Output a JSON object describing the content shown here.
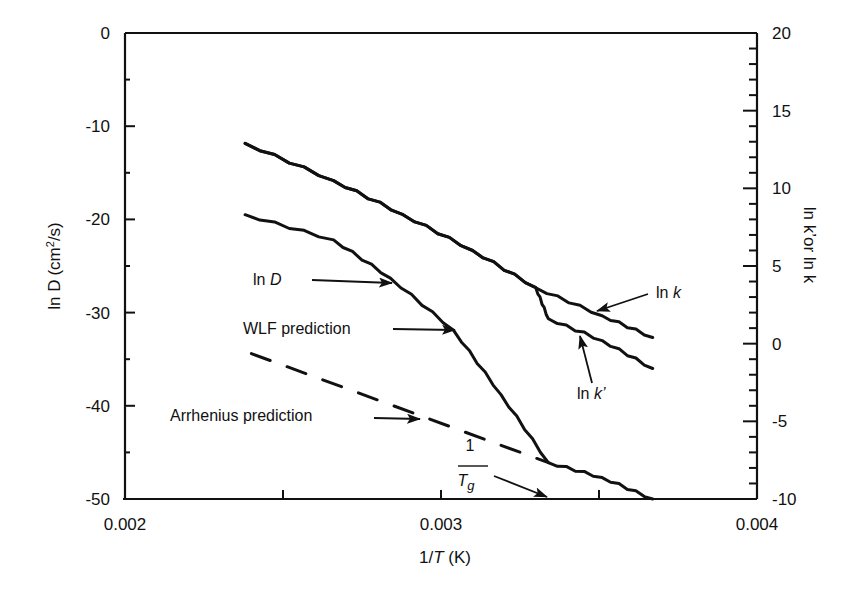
{
  "chart_data": {
    "type": "line",
    "title": "",
    "xlabel": "1/T (K)",
    "ylabel": "ln D  (cm2/s)",
    "y2label": "ln k' or ln k",
    "xlim": [
      0.002,
      0.004
    ],
    "ylim": [
      -50,
      0
    ],
    "y2lim": [
      -10,
      20
    ],
    "x_ticks": [
      "0.002",
      "0.003",
      "0.004"
    ],
    "y_ticks": [
      "0",
      "-10",
      "-20",
      "-30",
      "-40",
      "-50"
    ],
    "y2_ticks": [
      "20",
      "15",
      "10",
      "5",
      "0",
      "-5",
      "-10"
    ],
    "grid": false,
    "legend": "none (inline annotations with arrows)",
    "series": [
      {
        "name": "ln D",
        "axis": "left",
        "style": "solid",
        "x": [
          0.00238,
          0.00266,
          0.00284,
          0.00304,
          0.00319,
          0.00334,
          0.00351,
          0.00367
        ],
        "y": [
          -19.5,
          -22.2,
          -26.3,
          -31.9,
          -38.8,
          -46.1,
          -47.7,
          -50.0
        ]
      },
      {
        "name": "ln k",
        "axis": "right",
        "style": "solid",
        "x": [
          0.00238,
          0.00266,
          0.00288,
          0.0031,
          0.0033,
          0.00351,
          0.00367
        ],
        "y": [
          12.9,
          10.5,
          8.3,
          6.0,
          3.6,
          1.8,
          0.4
        ]
      },
      {
        "name": "ln k'",
        "axis": "right",
        "style": "solid",
        "x": [
          0.00238,
          0.00266,
          0.00288,
          0.0031,
          0.0033,
          0.00334,
          0.00351,
          0.00367
        ],
        "y": [
          12.9,
          10.5,
          8.3,
          6.0,
          3.6,
          1.6,
          0.2,
          -1.6
        ]
      },
      {
        "name": "Arrhenius prediction",
        "axis": "left",
        "style": "dashed",
        "x": [
          0.0024,
          0.00334
        ],
        "y": [
          -34.4,
          -46.1
        ]
      }
    ],
    "annotations": [
      {
        "text": "ln D",
        "points_to": "ln D curve"
      },
      {
        "text": "WLF prediction",
        "points_to": "ln D curve (WLF region)"
      },
      {
        "text": "Arrhenius prediction",
        "points_to": "dashed line"
      },
      {
        "text": "1/Tg",
        "points_to": "glass transition point on x-axis"
      },
      {
        "text": "ln k",
        "points_to": "ln k curve"
      },
      {
        "text": "ln k'",
        "points_to": "ln k' curve"
      }
    ]
  },
  "labels": {
    "y_title_main": "ln D",
    "y_title_unit": "(cm",
    "y_title_sup": "2",
    "y_title_tail": "/s)",
    "y2_title": "ln k’or ln k",
    "x_title_pre": "1/",
    "x_title_italic": "T",
    "x_title_post": " (K)",
    "anno_lnD": "ln ",
    "anno_lnD_it": "D",
    "anno_wlf": "WLF prediction",
    "anno_arrhenius": "Arrhenius prediction",
    "anno_tg_num": "1",
    "anno_tg_den": "T",
    "anno_tg_sub": "g",
    "anno_lnk": "ln ",
    "anno_lnk_it": "k",
    "anno_lnkp": "ln ",
    "anno_lnkp_it": "k’"
  }
}
